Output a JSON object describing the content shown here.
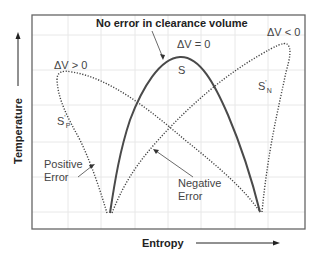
{
  "diagram": {
    "title": "No error in clearance volume",
    "x_axis_label": "Entropy",
    "y_axis_label": "Temperature",
    "curves": [
      {
        "id": "S",
        "label": "S",
        "condition": "ΔV = 0",
        "style": "solid"
      },
      {
        "id": "S_P",
        "label_main": "S",
        "label_sub": "P",
        "prime": "'",
        "condition": "ΔV > 0",
        "style": "dotted",
        "annotation": "Positive Error"
      },
      {
        "id": "S_N",
        "label_main": "S",
        "label_sub": "N",
        "prime": "'",
        "condition": "ΔV < 0",
        "style": "dotted",
        "annotation": "Negative Error"
      }
    ],
    "annotations": {
      "positive_error_line1": "Positive",
      "positive_error_line2": "Error",
      "negative_error_line1": "Negative",
      "negative_error_line2": "Error"
    },
    "colors": {
      "frame": "#555555",
      "grid": "#e6e6e6",
      "curve": "#555555",
      "text": "#333333"
    }
  }
}
